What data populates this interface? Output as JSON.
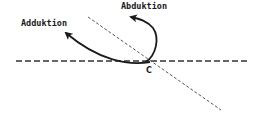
{
  "diagram": {
    "labels": {
      "adduktion": "Adduktion",
      "abduktion": "Abduktion",
      "center_point": "C"
    },
    "elements": [
      {
        "type": "axis-line",
        "style": "dashed",
        "orientation": "horizontal"
      },
      {
        "type": "axis-line",
        "style": "dashed-thin",
        "orientation": "diagonal"
      },
      {
        "type": "motion-arrow",
        "name": "adduktion",
        "direction": "up-left"
      },
      {
        "type": "motion-arrow",
        "name": "abduktion",
        "direction": "up-left-loop"
      }
    ],
    "colors": {
      "line": "#1a1a1a",
      "background": "#ffffff"
    }
  }
}
